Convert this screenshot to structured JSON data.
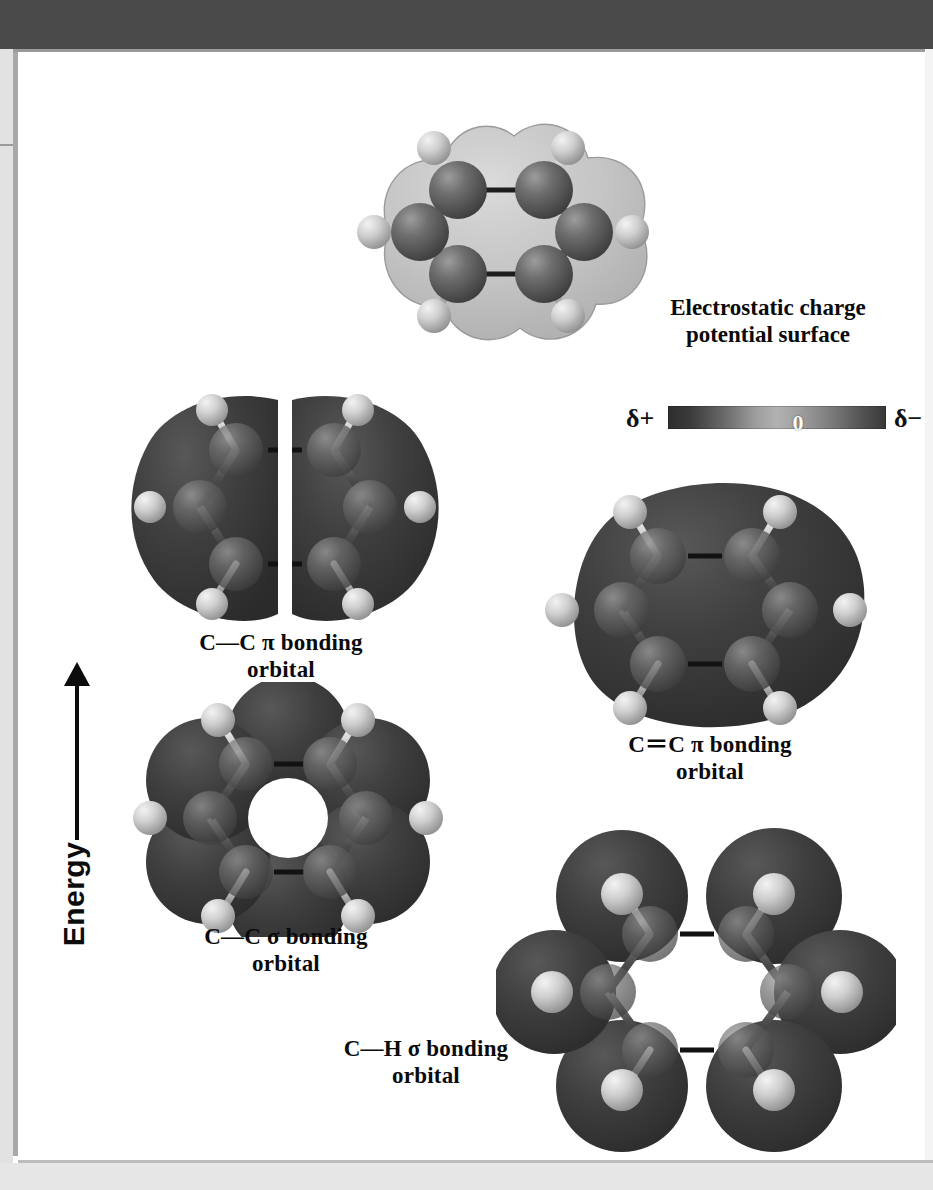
{
  "page": {
    "kind": "textbook-figure"
  },
  "axis": {
    "label": "Energy",
    "direction": "up"
  },
  "legend": {
    "title_line1": "Electrostatic charge",
    "title_line2": "potential surface",
    "scale": {
      "left_label": "δ+",
      "center_label": "0",
      "right_label": "δ−"
    }
  },
  "figures": [
    {
      "id": "electrostatic-potential-surface",
      "caption": "",
      "type": "space-filling-with-surface",
      "molecule": "benzene",
      "carbons": 6,
      "hydrogens": 6
    },
    {
      "id": "cc-pi-bonding-orbital",
      "caption_line1": "C—C π bonding",
      "caption_line2": "orbital",
      "type": "orbital-lobes",
      "lobes": 2,
      "molecule": "benzene"
    },
    {
      "id": "cc-double-pi-bonding-orbital",
      "caption_line1": "C＝C π bonding",
      "caption_line2": "orbital",
      "type": "orbital-lobes",
      "lobes": 1,
      "molecule": "benzene"
    },
    {
      "id": "cc-sigma-bonding-orbital",
      "caption_line1": "C—C σ bonding",
      "caption_line2": "orbital",
      "type": "orbital-lobes",
      "lobes": 6,
      "molecule": "benzene"
    },
    {
      "id": "ch-sigma-bonding-orbital",
      "caption_line1": "C—H σ bonding",
      "caption_line2": "orbital",
      "type": "orbital-lobes",
      "lobes": 6,
      "molecule": "benzene"
    }
  ],
  "colors": {
    "header_bar": "#4a4a4a",
    "page_background": "#ffffff",
    "margin": "#e2e2e2",
    "orbital_lobe": "#3c3c3c",
    "carbon_sphere": "#5a5a5a",
    "hydrogen_sphere": "#c9c9c9",
    "text": "#0a0a0a"
  }
}
